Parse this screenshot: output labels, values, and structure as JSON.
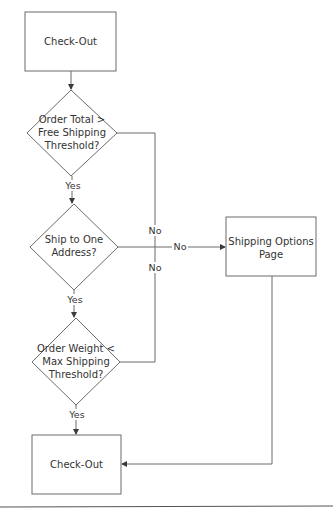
{
  "diagram": {
    "type": "flowchart",
    "nodes": {
      "start": {
        "kind": "process",
        "label": "Check-Out"
      },
      "decision_total": {
        "kind": "decision",
        "lines": [
          "Order Total >",
          "Free Shipping",
          "Threshold?"
        ]
      },
      "decision_address": {
        "kind": "decision",
        "lines": [
          "Ship to One",
          "Address?"
        ]
      },
      "decision_weight": {
        "kind": "decision",
        "lines": [
          "Order Weight <",
          "Max Shipping",
          "Threshold?"
        ]
      },
      "shipping_options": {
        "kind": "process",
        "lines": [
          "Shipping Options",
          "Page"
        ]
      },
      "end": {
        "kind": "process",
        "label": "Check-Out"
      }
    },
    "edges": {
      "start_to_total": {
        "from": "start",
        "to": "decision_total",
        "label": ""
      },
      "total_yes": {
        "from": "decision_total",
        "to": "decision_address",
        "label": "Yes"
      },
      "address_yes": {
        "from": "decision_address",
        "to": "decision_weight",
        "label": "Yes"
      },
      "weight_yes": {
        "from": "decision_weight",
        "to": "end",
        "label": "Yes"
      },
      "total_no": {
        "from": "decision_total",
        "to": "shipping_options",
        "label": "No"
      },
      "address_no": {
        "from": "decision_address",
        "to": "shipping_options",
        "label": "No"
      },
      "weight_no": {
        "from": "decision_weight",
        "to": "shipping_options",
        "label": "No"
      },
      "options_to_end": {
        "from": "shipping_options",
        "to": "end",
        "label": ""
      }
    }
  }
}
